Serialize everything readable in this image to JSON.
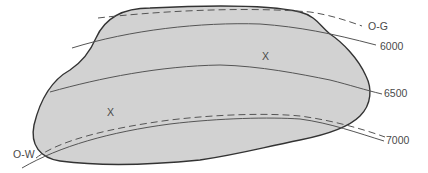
{
  "diagram": {
    "type": "reservoir-contour-map",
    "colors": {
      "reservoir_fill": "#d2d2d2",
      "outline": "#333333",
      "contour": "#555555",
      "text": "#4a4a4a",
      "background": "#ffffff"
    },
    "labels": {
      "gas_oil_contact": "O-G",
      "oil_water_contact": "O-W",
      "contour_6000": "6000",
      "contour_6500": "6500",
      "contour_7000": "7000",
      "well_marker_1": "X",
      "well_marker_2": "X"
    }
  }
}
